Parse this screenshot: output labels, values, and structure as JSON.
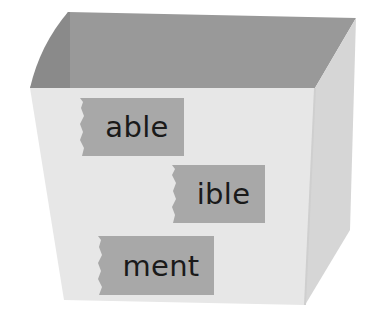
{
  "figure": {
    "colors": {
      "inner_back": "#9a9a9a",
      "inner_left": "#8c8c8c",
      "front_face": "#e6e6e6",
      "side_face": "#d9d9d9",
      "tape": "#a9a9a9",
      "text": "#1a1a1a",
      "background": "#ffffff"
    },
    "labels": [
      {
        "text": "able"
      },
      {
        "text": "ible"
      },
      {
        "text": "ment"
      }
    ]
  }
}
